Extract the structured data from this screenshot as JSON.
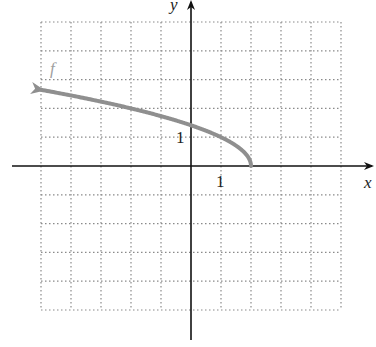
{
  "chart_data": {
    "type": "line",
    "title": "",
    "xlabel": "x",
    "ylabel": "y",
    "xlim": [
      -5,
      5
    ],
    "ylim": [
      -5,
      5
    ],
    "grid": true,
    "tick_labels": {
      "x": [
        "1"
      ],
      "y": [
        "1"
      ]
    },
    "series": [
      {
        "name": "f",
        "formula": "f(x) = sqrt(2 - x)",
        "color": "#8f8f8f",
        "domain": [
          -5,
          2
        ],
        "arrow": "left",
        "points": [
          [
            -5,
            2.65
          ],
          [
            -4,
            2.45
          ],
          [
            -3,
            2.24
          ],
          [
            -2,
            2.0
          ],
          [
            -1,
            1.73
          ],
          [
            0,
            1.41
          ],
          [
            1,
            1.0
          ],
          [
            1.5,
            0.71
          ],
          [
            2,
            0
          ]
        ]
      }
    ]
  }
}
